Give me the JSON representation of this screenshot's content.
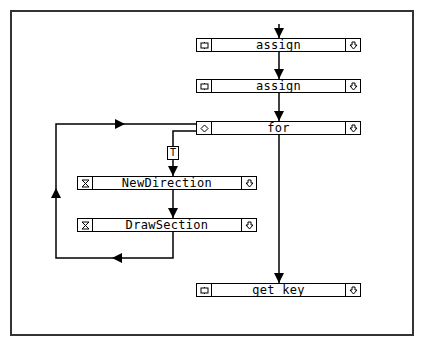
{
  "diagram": {
    "type": "flowchart",
    "nodes": [
      {
        "id": "assign1",
        "label": "assign",
        "left_icon": "statement-icon",
        "right_icon": "expand-down-icon"
      },
      {
        "id": "assign2",
        "label": "assign",
        "left_icon": "statement-icon",
        "right_icon": "expand-down-icon"
      },
      {
        "id": "for",
        "label": "for",
        "left_icon": "loop-diamond-icon",
        "right_icon": "expand-down-icon"
      },
      {
        "id": "newdir",
        "label": "NewDirection",
        "left_icon": "hourglass-icon",
        "right_icon": "expand-down-icon"
      },
      {
        "id": "drawsec",
        "label": "DrawSection",
        "left_icon": "hourglass-icon",
        "right_icon": "expand-down-icon"
      },
      {
        "id": "getkey",
        "label": "get key",
        "left_icon": "statement-icon",
        "right_icon": "expand-down-icon"
      }
    ],
    "edges": [
      {
        "from": "start",
        "to": "assign1"
      },
      {
        "from": "assign1",
        "to": "assign2"
      },
      {
        "from": "assign2",
        "to": "for"
      },
      {
        "from": "for",
        "to": "newdir",
        "label": "T"
      },
      {
        "from": "newdir",
        "to": "drawsec"
      },
      {
        "from": "drawsec",
        "to": "for",
        "kind": "loop-back"
      },
      {
        "from": "for",
        "to": "getkey"
      }
    ],
    "true_badge": "T"
  }
}
